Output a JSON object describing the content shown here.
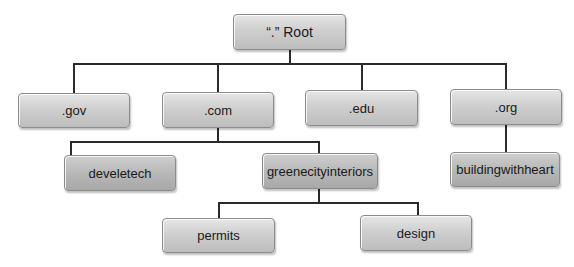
{
  "diagram": {
    "type": "dns-hierarchy-tree",
    "root": {
      "label": "“.” Root"
    },
    "tlds": [
      {
        "label": ".gov"
      },
      {
        "label": ".com"
      },
      {
        "label": ".edu"
      },
      {
        "label": ".org"
      }
    ],
    "second_level": {
      "com": [
        {
          "label": "develetech"
        },
        {
          "label": "greenecityinteriors"
        }
      ],
      "org": [
        {
          "label": "buildingwithheart"
        }
      ]
    },
    "third_level": {
      "greenecityinteriors": [
        {
          "label": "permits"
        },
        {
          "label": "design"
        }
      ]
    }
  },
  "edges": [
    [
      "root",
      ".gov"
    ],
    [
      "root",
      ".com"
    ],
    [
      "root",
      ".edu"
    ],
    [
      "root",
      ".org"
    ],
    [
      ".com",
      "develetech"
    ],
    [
      ".com",
      "greenecityinteriors"
    ],
    [
      ".org",
      "buildingwithheart"
    ],
    [
      "greenecityinteriors",
      "permits"
    ],
    [
      "greenecityinteriors",
      "design"
    ]
  ]
}
